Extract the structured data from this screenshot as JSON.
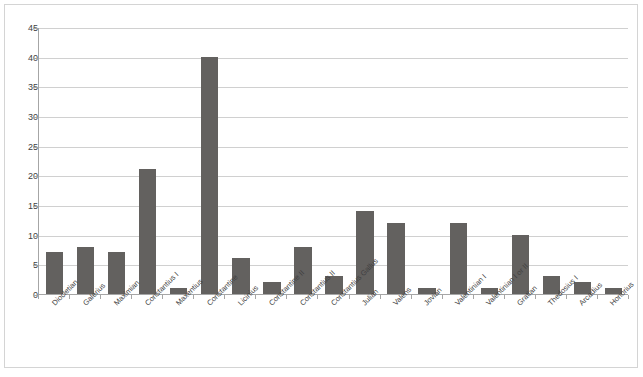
{
  "chart_data": {
    "type": "bar",
    "title": "",
    "subtitle": "",
    "xlabel": "",
    "ylabel": "",
    "ylim": [
      0,
      45
    ],
    "ytick_step": 5,
    "ytick_labels": [
      "0",
      "5",
      "10",
      "15",
      "20",
      "25",
      "30",
      "35",
      "40",
      "45"
    ],
    "grid": true,
    "legend": "none",
    "bar_color": "#63615f",
    "gridline_color": "#d0d0d0",
    "axis_color": "#a6a6a6",
    "categories": [
      "Diocletian",
      "Galerius",
      "Maximian",
      "Constantius I",
      "Maxentius",
      "Constantine",
      "Licinius",
      "Constantine II",
      "Constantius II",
      "Constantius Gallus",
      "Julian",
      "Valens",
      "Jovian",
      "Valentinian I",
      "Valentinian I or II",
      "Gratian",
      "Thedosius I",
      "Arcadius",
      "Honorius"
    ],
    "values": [
      7,
      8,
      7,
      21,
      1,
      40,
      6,
      2,
      8,
      3,
      14,
      12,
      1,
      12,
      1,
      10,
      3,
      2,
      1
    ]
  }
}
